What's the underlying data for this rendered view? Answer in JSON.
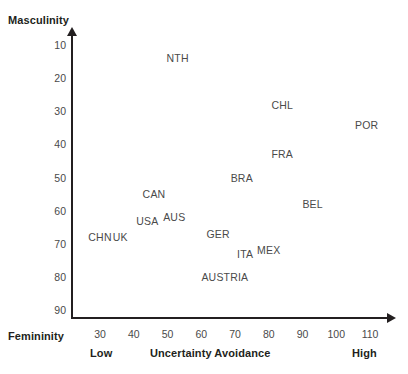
{
  "chart_data": {
    "type": "scatter",
    "title": "",
    "xlabel": "Uncertainty Avoidance",
    "ylabel": "Masculinity",
    "ylabel_bottom": "Femininity",
    "xlabel_low": "Low",
    "xlabel_high": "High",
    "xlim": [
      20,
      115
    ],
    "ylim": [
      5,
      95
    ],
    "y_inverted": true,
    "grid": false,
    "legend": "none",
    "xticks": [
      30,
      40,
      50,
      60,
      70,
      80,
      90,
      100,
      110
    ],
    "yticks": [
      10,
      20,
      30,
      40,
      50,
      60,
      70,
      80,
      90
    ],
    "points": [
      {
        "label": "NTH",
        "x": 53,
        "y": 14
      },
      {
        "label": "CHL",
        "x": 84,
        "y": 28
      },
      {
        "label": "POR",
        "x": 109,
        "y": 34
      },
      {
        "label": "FRA",
        "x": 84,
        "y": 43
      },
      {
        "label": "BRA",
        "x": 72,
        "y": 50
      },
      {
        "label": "CAN",
        "x": 46,
        "y": 55
      },
      {
        "label": "BEL",
        "x": 93,
        "y": 58
      },
      {
        "label": "USA",
        "x": 44,
        "y": 63
      },
      {
        "label": "AUS",
        "x": 52,
        "y": 62
      },
      {
        "label": "CHN",
        "x": 30,
        "y": 68
      },
      {
        "label": "UK",
        "x": 36,
        "y": 68
      },
      {
        "label": "GER",
        "x": 65,
        "y": 67
      },
      {
        "label": "MEX",
        "x": 80,
        "y": 72
      },
      {
        "label": "ITA",
        "x": 73,
        "y": 73
      },
      {
        "label": "AUSTRIA",
        "x": 67,
        "y": 80
      }
    ]
  },
  "colors": {
    "axis": "#231f20",
    "text": "#4a4a4a",
    "title": "#231f20",
    "background": "#ffffff"
  }
}
